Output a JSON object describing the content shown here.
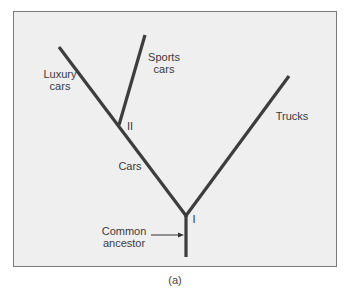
{
  "figure": {
    "caption": "(a)",
    "colors": {
      "panel_bg": "#efefef",
      "border": "#7a7a7a",
      "line": "#3d3d3d",
      "text": "#3a3a3a"
    }
  },
  "labels": {
    "luxury_line1": "Luxury",
    "luxury_line2": "cars",
    "sports_line1": "Sports",
    "sports_line2": "cars",
    "trucks": "Trucks",
    "cars": "Cars",
    "node_ii": "II",
    "node_i": "I",
    "ancestor_line1": "Common",
    "ancestor_line2": "ancestor"
  },
  "tree": {
    "nodes": [
      {
        "id": "I",
        "x": 186,
        "y": 217
      },
      {
        "id": "II",
        "x": 119,
        "y": 124
      }
    ],
    "branches": [
      {
        "name": "trunk",
        "from": [
          186,
          257
        ],
        "to": [
          186,
          217
        ]
      },
      {
        "name": "cars",
        "from": [
          186,
          217
        ],
        "to": [
          119,
          124
        ]
      },
      {
        "name": "trucks",
        "from": [
          186,
          217
        ],
        "to": [
          289,
          76
        ]
      },
      {
        "name": "luxury-cars",
        "from": [
          119,
          124
        ],
        "to": [
          59,
          47
        ]
      },
      {
        "name": "sports-cars",
        "from": [
          119,
          124
        ],
        "to": [
          145,
          35
        ]
      }
    ]
  }
}
